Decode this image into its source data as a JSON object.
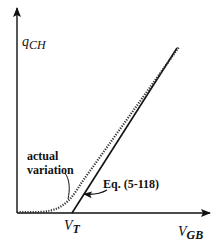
{
  "diagram": {
    "y_axis_label": {
      "main": "q",
      "sub": "CH"
    },
    "x_axis_label": {
      "main": "V",
      "sub": "GB"
    },
    "threshold_label": {
      "main": "V",
      "sub": "T"
    },
    "annotation_actual": {
      "line1": "actual",
      "line2": "variation"
    },
    "annotation_equation": "Eq. (5-118)",
    "curves": [
      {
        "name": "linear approximation",
        "style": "solid"
      },
      {
        "name": "actual variation",
        "style": "dotted"
      }
    ],
    "colors": {
      "ink": "#111111",
      "background": "#ffffff"
    }
  }
}
